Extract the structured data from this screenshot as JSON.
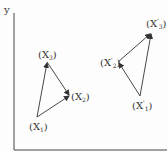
{
  "diagram": {
    "axis_label_y": "y",
    "original_triangle": {
      "points": {
        "X1": {
          "label": "(X",
          "sub": "1",
          "prime": "",
          "x": 37,
          "y": 117
        },
        "X2": {
          "label": "(X",
          "sub": "2",
          "prime": "",
          "x": 70,
          "y": 95
        },
        "X3": {
          "label": "(X",
          "sub": "3",
          "prime": "",
          "x": 47,
          "y": 62
        }
      },
      "edges": [
        [
          "X1",
          "X3"
        ],
        [
          "X3",
          "X2"
        ],
        [
          "X1",
          "X2"
        ]
      ]
    },
    "transformed_triangle": {
      "points": {
        "X1p": {
          "label": "(X",
          "sub": "1",
          "prime": "'",
          "x": 140,
          "y": 96
        },
        "X2p": {
          "label": "(X",
          "sub": "2",
          "prime": "'",
          "x": 118,
          "y": 62
        },
        "X3p": {
          "label": "(X",
          "sub": "3",
          "prime": "'",
          "x": 151,
          "y": 33
        }
      },
      "edges": [
        [
          "X1p",
          "X2p"
        ],
        [
          "X2p",
          "X3p"
        ],
        [
          "X1p",
          "X3p"
        ]
      ]
    },
    "colors": {
      "stroke": "#333333",
      "axis": "#444444"
    }
  }
}
